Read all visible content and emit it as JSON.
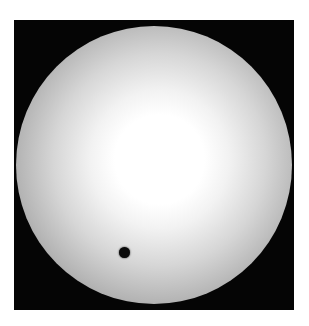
{
  "image": {
    "subject": "planetary transit across solar disk",
    "colors": {
      "background": "#050505",
      "disk_center": "#ffffff",
      "disk_limb": "#6a6a6a",
      "planet": "#0a0a0a"
    }
  },
  "caption": {
    "text": ""
  }
}
